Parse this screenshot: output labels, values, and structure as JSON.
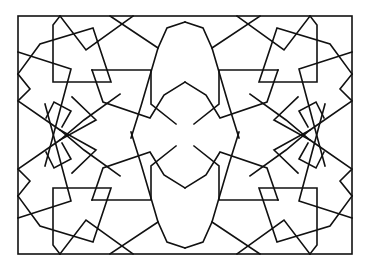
{
  "figure": {
    "title": "",
    "stroke_color": "#111111",
    "background_color": "#ffffff"
  },
  "pattern": {
    "border": [
      18,
      16,
      352,
      254
    ],
    "center": [
      185,
      135
    ],
    "quadrant_polylines": [
      [
        [
          60,
          16
        ],
        [
          86,
          50
        ],
        [
          133,
          16
        ]
      ],
      [
        [
          60,
          16
        ],
        [
          53,
          25
        ],
        [
          53,
          82
        ],
        [
          111,
          82
        ],
        [
          93,
          28
        ],
        [
          40,
          44
        ],
        [
          18,
          74
        ]
      ],
      [
        [
          18,
          52
        ],
        [
          71,
          69
        ],
        [
          56,
          126
        ],
        [
          18,
          98
        ]
      ],
      [
        [
          18,
          74
        ],
        [
          30,
          89
        ],
        [
          18,
          98
        ]
      ],
      [
        [
          18,
          98
        ],
        [
          56,
          126
        ],
        [
          111,
          160
        ],
        [
          118,
          118
        ],
        [
          150,
          120
        ]
      ],
      [
        [
          40,
          235
        ],
        [
          47,
          208
        ]
      ],
      [
        [
          185,
          119
        ],
        [
          150,
          100
        ],
        [
          143,
          90
        ],
        [
          143,
          70
        ],
        [
          92,
          70
        ],
        [
          102,
          103
        ],
        [
          150,
          120
        ]
      ],
      [
        [
          92,
          70
        ],
        [
          101,
          103
        ],
        [
          150,
          118
        ]
      ],
      [
        [
          109,
          16
        ],
        [
          160,
          42
        ],
        [
          175,
          32
        ],
        [
          185,
          36
        ]
      ],
      [
        [
          160,
          42
        ],
        [
          167,
          62
        ],
        [
          185,
          60
        ]
      ],
      [
        [
          143,
          70
        ],
        [
          112,
          160
        ]
      ],
      [
        [
          53,
          82
        ],
        [
          71,
          69
        ]
      ],
      [
        [
          118,
          118
        ],
        [
          111,
          160
        ]
      ]
    ]
  }
}
